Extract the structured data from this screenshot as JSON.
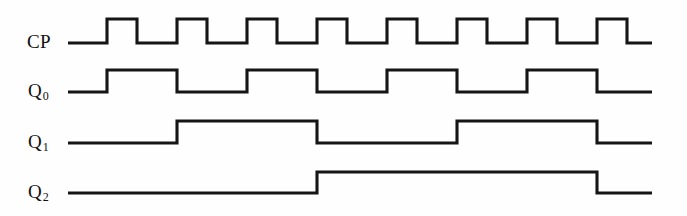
{
  "figure": {
    "type": "digital-timing-diagram",
    "background_color": "#fefefe",
    "line_color": "#151515",
    "line_width": 3.1,
    "width": 687,
    "height": 216
  },
  "labels": {
    "cp": "CP",
    "q0_base": "Q",
    "q0_sub": "0",
    "q1_base": "Q",
    "q1_sub": "1",
    "q2_base": "Q",
    "q2_sub": "2"
  },
  "chart_data": {
    "type": "line",
    "title": "",
    "xlabel": "",
    "ylabel": "",
    "grid": false,
    "legend": "none",
    "time_axis": {
      "start_px": 68,
      "end_px": 652,
      "clock_period_px": 70,
      "clock_first_rise_px": 107,
      "clock_high_width_px": 30,
      "clock_pulse_count": 8
    },
    "signals": [
      {
        "name": "CP",
        "label": "CP",
        "baseline_y": 43,
        "high_y": 19,
        "initial_level": 0,
        "transitions_px": [
          107,
          137,
          177,
          207,
          247,
          277,
          317,
          347,
          387,
          417,
          457,
          487,
          527,
          557,
          597,
          627
        ],
        "levels": [
          0,
          1,
          0,
          1,
          0,
          1,
          0,
          1,
          0,
          1,
          0,
          1,
          0,
          1,
          0,
          1,
          0
        ],
        "bit_sequence": [
          0,
          1,
          0,
          1,
          0,
          1,
          0,
          1,
          0,
          1,
          0,
          1,
          0,
          1,
          0,
          1,
          0
        ]
      },
      {
        "name": "Q0",
        "label": "Q0",
        "baseline_y": 92,
        "high_y": 70,
        "initial_level": 0,
        "transitions_px": [
          107,
          177,
          247,
          317,
          387,
          457,
          527,
          597
        ],
        "levels": [
          0,
          1,
          0,
          1,
          0,
          1,
          0,
          1,
          0
        ],
        "bit_sequence": [
          0,
          1,
          0,
          1,
          0,
          1,
          0,
          1,
          0
        ]
      },
      {
        "name": "Q1",
        "label": "Q1",
        "baseline_y": 143,
        "high_y": 121,
        "initial_level": 0,
        "transitions_px": [
          177,
          317,
          457,
          597
        ],
        "levels": [
          0,
          1,
          0,
          1,
          0
        ],
        "bit_sequence": [
          0,
          1,
          0,
          1,
          0
        ]
      },
      {
        "name": "Q2",
        "label": "Q2",
        "baseline_y": 193,
        "high_y": 172,
        "initial_level": 0,
        "transitions_px": [
          317,
          597
        ],
        "levels": [
          0,
          1,
          0
        ],
        "bit_sequence": [
          0,
          1,
          0
        ]
      }
    ]
  }
}
